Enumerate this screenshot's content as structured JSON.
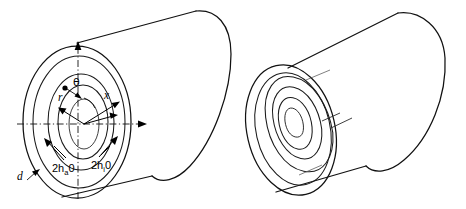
{
  "figure": {
    "background_color": "#ffffff",
    "line_color": "#111111",
    "width": 466,
    "height": 209
  },
  "left_figure": {
    "name": "annular-cylinder-with-coordinates",
    "description": "Cylinder shown in perspective with concentric annular rings on the near face and a polar coordinate system",
    "labels": {
      "theta": "θ",
      "radius": "r",
      "axial": "x",
      "thickness": "d",
      "outer_gap": "2h",
      "outer_gap_sub": "a",
      "outer_gap_zero": "0",
      "inner_gap": "2h",
      "inner_gap_sub": "i",
      "inner_gap_zero": "0"
    },
    "axes": {
      "vertical_axis_style": "dash-dot with arrowhead up",
      "horizontal_axis_style": "dash-dot with arrowhead right",
      "axial_axis_style": "solid line with arrowhead up-right"
    },
    "rings": 4,
    "point_marker": "origin-point-dot"
  },
  "right_figure": {
    "name": "spiral-wound-cylinder",
    "description": "Cylinder shown in perspective with a continuous spiral (scroll) wound on the near face",
    "spiral_turns": 3,
    "labels": {}
  }
}
